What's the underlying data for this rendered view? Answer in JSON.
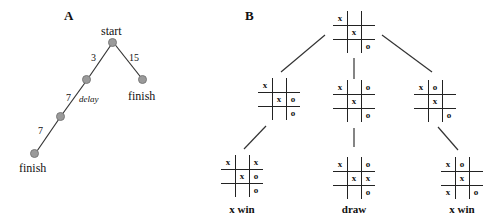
{
  "panel_a": {
    "label": "A",
    "nodes": {
      "start": "start",
      "finish_right": "finish",
      "finish_bottom": "finish"
    },
    "edges": {
      "start_to_mid": "3",
      "start_to_finish": "15",
      "mid_to_mid2": "7",
      "mid2_to_finish": "7"
    },
    "annotation": "delay"
  },
  "panel_b": {
    "label": "B",
    "boards": {
      "root": [
        "x",
        "",
        "",
        "",
        "x",
        "",
        "",
        "",
        "o"
      ],
      "left": [
        "x",
        "",
        "",
        "",
        "x",
        "o",
        "",
        "",
        "o"
      ],
      "center": [
        "x",
        "",
        "o",
        "",
        "x",
        "",
        "",
        "",
        "o"
      ],
      "right": [
        "x",
        "o",
        "",
        "",
        "x",
        "",
        "",
        "",
        "o"
      ],
      "left_leaf": [
        "x",
        "",
        "x",
        "",
        "x",
        "o",
        "",
        "",
        "o"
      ],
      "center_leaf": [
        "x",
        "",
        "o",
        "",
        "x",
        "x",
        "",
        "",
        "o"
      ],
      "right_leaf": [
        "x",
        "o",
        "",
        "",
        "x",
        "",
        "x",
        "",
        "o"
      ]
    },
    "results": {
      "left": "x win",
      "center": "draw",
      "right": "x win"
    }
  }
}
